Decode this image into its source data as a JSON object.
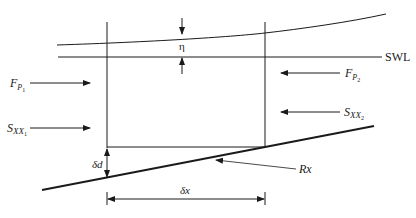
{
  "diagram": {
    "type": "control-volume force balance (wave setup on sloping beach)",
    "labels": {
      "swl": "SWL",
      "eta": "η",
      "fp1": {
        "main": "F",
        "sub": "P",
        "subsub": "1"
      },
      "fp2": {
        "main": "F",
        "sub": "P",
        "subsub": "2"
      },
      "sxx1": {
        "main": "S",
        "sub": "XX",
        "subsub": "1"
      },
      "sxx2": {
        "main": "S",
        "sub": "XX",
        "subsub": "2"
      },
      "delta_d": "δd",
      "delta_x": "δx",
      "rx": "Rx"
    },
    "colors": {
      "line": "#1a1a1a",
      "background": "#ffffff"
    }
  }
}
